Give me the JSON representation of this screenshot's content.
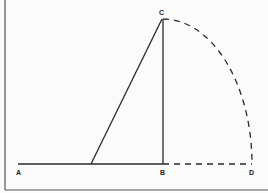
{
  "diagram": {
    "points": {
      "A": {
        "label": "A",
        "x": 18,
        "y": 164
      },
      "B": {
        "label": "B",
        "x": 163,
        "y": 164
      },
      "C": {
        "label": "C",
        "x": 162,
        "y": 19
      },
      "D": {
        "label": "D",
        "x": 252,
        "y": 164
      }
    },
    "hypotenuse_base": {
      "x": 91,
      "y": 164
    },
    "colors": {
      "line": "#2a2a2a",
      "frame": "#555555",
      "background": "#fbfbfb"
    }
  }
}
